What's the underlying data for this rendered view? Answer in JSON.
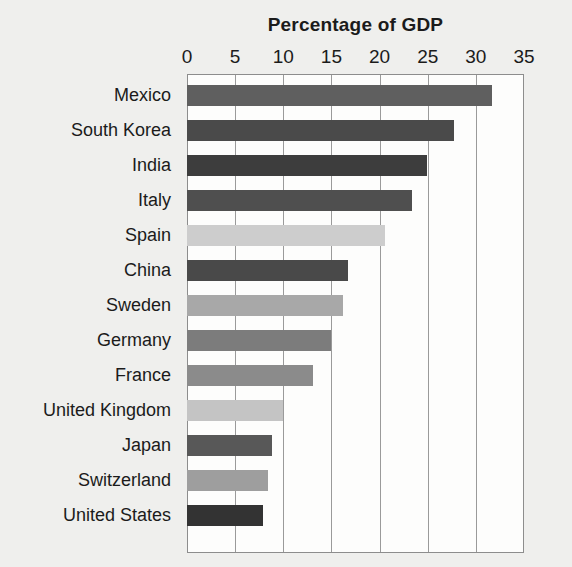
{
  "chart_data": {
    "type": "bar",
    "orientation": "horizontal",
    "title": "Percentage of GDP",
    "xlabel": "",
    "ylabel": "",
    "xlim": [
      0,
      35
    ],
    "xticks": [
      0,
      5,
      10,
      15,
      20,
      25,
      30,
      35
    ],
    "xtick_labels": [
      "0",
      "5",
      "10",
      "15",
      "20",
      "25",
      "30",
      "35"
    ],
    "grid": true,
    "legend": "none",
    "categories": [
      "Mexico",
      "South Korea",
      "India",
      "Italy",
      "Spain",
      "China",
      "Sweden",
      "Germany",
      "France",
      "United Kingdom",
      "Japan",
      "Switzerland",
      "United States"
    ],
    "values": [
      31.7,
      27.7,
      24.9,
      23.4,
      20.6,
      16.7,
      16.2,
      15.0,
      13.1,
      10.0,
      8.8,
      8.4,
      7.9
    ],
    "bar_colors": [
      "#5f5f5f",
      "#4a4a4a",
      "#3d3d3d",
      "#4f4f4f",
      "#cdcdcd",
      "#494949",
      "#a8a8a8",
      "#7c7c7c",
      "#8b8b8b",
      "#c4c4c4",
      "#585858",
      "#9e9e9e",
      "#333333"
    ]
  },
  "plot": {
    "background": "#fdfdfc",
    "page_background": "#efefed",
    "axis_color": "#8d8d8d",
    "gridline_color": "#9a9a9a"
  }
}
